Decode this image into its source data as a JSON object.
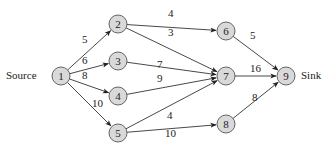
{
  "diagram": {
    "type": "network-flow",
    "source_label": "Source",
    "sink_label": "Sink",
    "node_fill": "#d9d9d9",
    "node_stroke": "#555555",
    "edge_color": "#333333",
    "nodes": [
      {
        "id": "1",
        "x": 61,
        "y": 76
      },
      {
        "id": "2",
        "x": 118,
        "y": 24
      },
      {
        "id": "3",
        "x": 118,
        "y": 61
      },
      {
        "id": "4",
        "x": 118,
        "y": 96
      },
      {
        "id": "5",
        "x": 118,
        "y": 133
      },
      {
        "id": "6",
        "x": 226,
        "y": 31
      },
      {
        "id": "7",
        "x": 226,
        "y": 76
      },
      {
        "id": "8",
        "x": 226,
        "y": 124
      },
      {
        "id": "9",
        "x": 286,
        "y": 76
      }
    ],
    "edges": [
      {
        "from": "1",
        "to": "2",
        "capacity": "5",
        "lx": 82,
        "ly": 40
      },
      {
        "from": "1",
        "to": "3",
        "capacity": "6",
        "lx": 82,
        "ly": 61
      },
      {
        "from": "1",
        "to": "4",
        "capacity": "8",
        "lx": 82,
        "ly": 76
      },
      {
        "from": "1",
        "to": "5",
        "capacity": "10",
        "lx": 92,
        "ly": 104
      },
      {
        "from": "2",
        "to": "6",
        "capacity": "4",
        "lx": 168,
        "ly": 14
      },
      {
        "from": "2",
        "to": "7",
        "capacity": "3",
        "lx": 168,
        "ly": 33
      },
      {
        "from": "3",
        "to": "7",
        "capacity": "7",
        "lx": 157,
        "ly": 65
      },
      {
        "from": "4",
        "to": "7",
        "capacity": "9",
        "lx": 157,
        "ly": 79
      },
      {
        "from": "5",
        "to": "7",
        "capacity": "4",
        "lx": 167,
        "ly": 116
      },
      {
        "from": "5",
        "to": "8",
        "capacity": "10",
        "lx": 165,
        "ly": 134
      },
      {
        "from": "6",
        "to": "9",
        "capacity": "5",
        "lx": 250,
        "ly": 36
      },
      {
        "from": "7",
        "to": "9",
        "capacity": "16",
        "lx": 250,
        "ly": 69
      },
      {
        "from": "8",
        "to": "9",
        "capacity": "8",
        "lx": 252,
        "ly": 98
      }
    ]
  }
}
